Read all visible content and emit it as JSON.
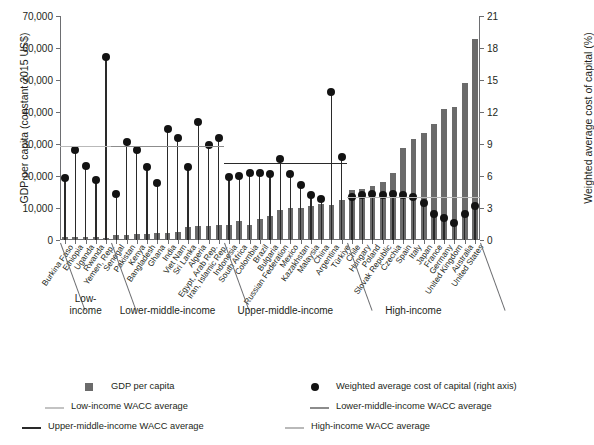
{
  "chart_data": {
    "type": "bar",
    "title": "",
    "xlabel": "",
    "ylabel": "GDP per capita (constant 2015 US$)",
    "y2label": "Weighted average cost of capital (%)",
    "ylim": [
      0,
      70000
    ],
    "y2lim": [
      0,
      21
    ],
    "yticks": [
      "0",
      "10,000",
      "20,000",
      "30,000",
      "40,000",
      "50,000",
      "60,000",
      "70,000"
    ],
    "ytick_values": [
      0,
      10000,
      20000,
      30000,
      40000,
      50000,
      60000,
      70000
    ],
    "y2ticks": [
      "0",
      "3",
      "6",
      "9",
      "12",
      "15",
      "18",
      "21"
    ],
    "y2tick_values": [
      0,
      3,
      6,
      9,
      12,
      15,
      18,
      21
    ],
    "grid": false,
    "legend_position": "bottom",
    "categories": [
      "Burkina Faso",
      "Ethiopia",
      "Uganda",
      "Rwanda",
      "Yemen, Rep.",
      "Senegal",
      "Pakistan",
      "Kenya",
      "Bangladesh",
      "Ghana",
      "India",
      "Viet Nam",
      "Sri Lanka",
      "Algeria",
      "Egypt, Arab Rep.",
      "Iran, Islamic Rep.",
      "Indonesia",
      "South Africa",
      "Colombia",
      "Brazil",
      "Bulgaria",
      "Russian Federation",
      "Mexico",
      "Kazakhstan",
      "Malaysia",
      "China",
      "Argentina",
      "Türkiye",
      "Chile",
      "Hungary",
      "Poland",
      "Slovak Republic",
      "Czechia",
      "Spain",
      "Italy",
      "Japan",
      "France",
      "Germany",
      "United Kingdom",
      "Australia",
      "United States"
    ],
    "series": [
      {
        "name": "GDP per capita",
        "axis": "left",
        "unit": "constant 2015 US$",
        "color": "#6b6b6b",
        "values": [
          830,
          1020,
          960,
          880,
          720,
          1540,
          1630,
          1840,
          1980,
          2200,
          2200,
          2370,
          4100,
          4450,
          4450,
          4600,
          4650,
          5900,
          4750,
          6600,
          7500,
          9400,
          10000,
          10000,
          10500,
          11200,
          11000,
          12500,
          15500,
          15900,
          16800,
          18200,
          21000,
          28700,
          31500,
          33500,
          36300,
          40800,
          41500,
          49200,
          62800
        ]
      },
      {
        "name": "Weighted average cost of capital (right axis)",
        "axis": "right",
        "unit": "%",
        "color": "#131313",
        "values": [
          5.8,
          8.4,
          6.9,
          5.6,
          17.2,
          4.3,
          9.2,
          8.4,
          6.8,
          5.3,
          10.4,
          9.6,
          6.8,
          11.1,
          8.9,
          9.6,
          5.9,
          6.0,
          6.3,
          6.3,
          6.2,
          7.6,
          6.2,
          5.2,
          4.2,
          3.8,
          13.9,
          7.8,
          4.0,
          4.2,
          4.3,
          4.2,
          4.3,
          4.2,
          4.0,
          3.5,
          2.4,
          2.1,
          1.6,
          2.4,
          3.2
        ]
      }
    ],
    "reference_lines": [
      {
        "name": "Low-income WACC average",
        "value": 8.7,
        "axis": "right",
        "color": "#b9b9b9",
        "start_index": 0,
        "end_index": 4
      },
      {
        "name": "Lower-middle-income WACC average",
        "value": 8.7,
        "axis": "right",
        "color": "#8c8c8c",
        "start_index": 5,
        "end_index": 15
      },
      {
        "name": "Upper-middle-income WACC average",
        "value": 7.1,
        "axis": "right",
        "color": "#2a2a2a",
        "start_index": 16,
        "end_index": 27
      },
      {
        "name": "High-income WACC average",
        "value": 3.9,
        "axis": "right",
        "color": "#b9b9b9",
        "start_index": 28,
        "end_index": 40
      }
    ],
    "groups": [
      {
        "label": "Low-\nincome",
        "start_index": 0,
        "end_index": 4
      },
      {
        "label": "Lower-middle-income",
        "start_index": 5,
        "end_index": 15
      },
      {
        "label": "Upper-middle-income",
        "start_index": 16,
        "end_index": 27
      },
      {
        "label": "High-income",
        "start_index": 28,
        "end_index": 40
      }
    ]
  },
  "legend": {
    "items": [
      {
        "label": "GDP per capita",
        "marker": "square",
        "color": "#6b6b6b"
      },
      {
        "label": "Weighted average cost of capital (right axis)",
        "marker": "dot",
        "color": "#131313"
      },
      {
        "label": "Low-income WACC average",
        "marker": "line",
        "color": "#c3c3c3"
      },
      {
        "label": "Lower-middle-income WACC average",
        "marker": "line",
        "color": "#8c8c8c"
      },
      {
        "label": "Upper-middle-income WACC average",
        "marker": "line",
        "color": "#2a2a2a"
      },
      {
        "label": "High-income WACC average",
        "marker": "line",
        "color": "#b9b9b9"
      }
    ]
  }
}
